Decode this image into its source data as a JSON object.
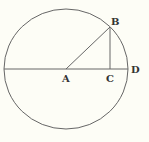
{
  "diagram": {
    "type": "geometry",
    "colors": {
      "background": "#fdfdf6",
      "stroke": "#666666",
      "label": "#333333"
    },
    "circle": {
      "cx": 66,
      "cy": 69,
      "rx": 62,
      "ry": 60
    },
    "points": {
      "A": {
        "x": 66,
        "y": 69,
        "label": "A"
      },
      "B": {
        "x": 110,
        "y": 27,
        "label": "B"
      },
      "C": {
        "x": 110,
        "y": 69,
        "label": "C"
      },
      "D": {
        "x": 128,
        "y": 69,
        "label": "D"
      }
    },
    "segments": [
      {
        "from": "left-edge",
        "to": "D",
        "name": "diameter"
      },
      {
        "from": "A",
        "to": "B",
        "name": "radius-AB"
      },
      {
        "from": "B",
        "to": "C",
        "name": "perpendicular-BC"
      }
    ]
  }
}
